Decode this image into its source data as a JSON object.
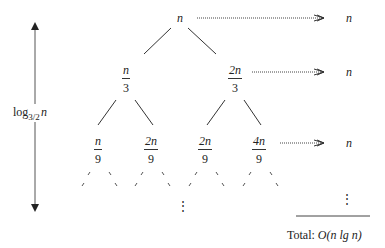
{
  "diagram": {
    "type": "recursion-tree",
    "root": {
      "label": "n"
    },
    "level1": [
      {
        "num": "n",
        "den": "3"
      },
      {
        "num": "2n",
        "den": "3"
      }
    ],
    "level2": [
      {
        "num": "n",
        "den": "9"
      },
      {
        "num": "2n",
        "den": "9"
      },
      {
        "num": "2n",
        "den": "9"
      },
      {
        "num": "4n",
        "den": "9"
      }
    ],
    "level_costs": [
      "n",
      "n",
      "n"
    ],
    "continuation": "⋮",
    "height_label": {
      "prefix": "log",
      "base": "3/2",
      "arg": "n"
    },
    "total": {
      "prefix": "Total:",
      "value": "O(n lg n)"
    },
    "colors": {
      "ink": "#222222",
      "background": "#ffffff"
    }
  }
}
